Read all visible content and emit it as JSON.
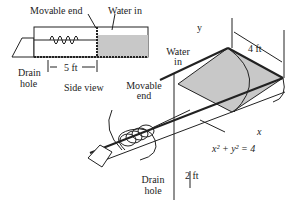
{
  "side_view": {
    "movable_end": "Movable end",
    "water_in": "Water in",
    "drain_hole_1": "Drain",
    "drain_hole_2": "hole",
    "length": "5 ft",
    "caption": "Side view"
  },
  "perspective": {
    "width": "4 ft",
    "water_in_1": "Water",
    "water_in_2": "in",
    "movable_end_1": "Movable",
    "movable_end_2": "end",
    "y_axis": "y",
    "x_axis": "x",
    "equation": "x² + y² = 4",
    "depth": "2 ft",
    "drain_hole_1": "Drain",
    "drain_hole_2": "hole"
  },
  "colors": {
    "water": "#c8c8c8",
    "line": "#222222"
  }
}
